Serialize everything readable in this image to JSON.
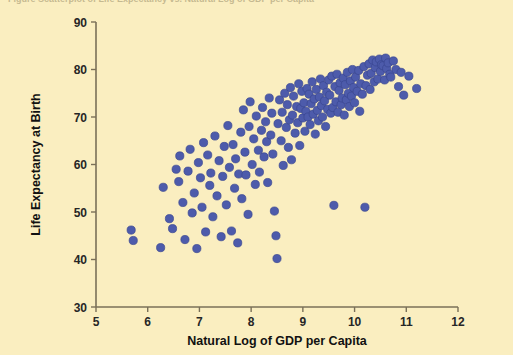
{
  "figure": {
    "cut_caption": "Figure   Scatterplot of Life Expectancy vs. Natural Log of GDP per Capita",
    "background_color": "#faeec0",
    "point_color": "#4d5bab",
    "point_edge_color": "#3a4690",
    "axis_color": "#7a7058",
    "text_color": "#111111"
  },
  "chart_data": {
    "type": "scatter",
    "title": "",
    "xlabel": "Natural Log of GDP per Capita",
    "ylabel": "Life Expectancy at Birth",
    "xlim": [
      5,
      12
    ],
    "ylim": [
      30,
      90
    ],
    "xticks": [
      5,
      6,
      7,
      8,
      9,
      10,
      11,
      12
    ],
    "yticks": [
      30,
      40,
      50,
      60,
      70,
      80,
      90
    ],
    "xtick_labels": [
      "5",
      "6",
      "7",
      "8",
      "9",
      "10",
      "11",
      "12"
    ],
    "ytick_labels": [
      "30",
      "40",
      "50",
      "60",
      "70",
      "80",
      "90"
    ],
    "grid": false,
    "legend": null,
    "marker": "circle",
    "marker_size": 8,
    "n_points": 172,
    "points": [
      [
        5.68,
        46.2
      ],
      [
        5.72,
        44.0
      ],
      [
        6.25,
        42.5
      ],
      [
        6.3,
        55.2
      ],
      [
        6.42,
        48.6
      ],
      [
        6.48,
        46.5
      ],
      [
        6.55,
        59.0
      ],
      [
        6.6,
        56.4
      ],
      [
        6.62,
        61.8
      ],
      [
        6.68,
        52.0
      ],
      [
        6.72,
        44.2
      ],
      [
        6.78,
        58.6
      ],
      [
        6.82,
        63.2
      ],
      [
        6.86,
        49.8
      ],
      [
        6.9,
        54.0
      ],
      [
        6.95,
        42.3
      ],
      [
        6.98,
        60.4
      ],
      [
        7.02,
        57.2
      ],
      [
        7.05,
        51.0
      ],
      [
        7.08,
        64.6
      ],
      [
        7.12,
        45.8
      ],
      [
        7.16,
        62.0
      ],
      [
        7.2,
        55.6
      ],
      [
        7.22,
        58.2
      ],
      [
        7.26,
        49.0
      ],
      [
        7.3,
        66.0
      ],
      [
        7.34,
        53.4
      ],
      [
        7.38,
        60.8
      ],
      [
        7.42,
        44.8
      ],
      [
        7.45,
        57.5
      ],
      [
        7.48,
        63.8
      ],
      [
        7.52,
        51.5
      ],
      [
        7.55,
        68.2
      ],
      [
        7.58,
        59.4
      ],
      [
        7.62,
        46.0
      ],
      [
        7.65,
        64.2
      ],
      [
        7.68,
        55.0
      ],
      [
        7.7,
        61.2
      ],
      [
        7.74,
        43.5
      ],
      [
        7.76,
        58.0
      ],
      [
        7.8,
        66.8
      ],
      [
        7.82,
        52.8
      ],
      [
        7.85,
        71.5
      ],
      [
        7.88,
        62.6
      ],
      [
        7.9,
        57.8
      ],
      [
        7.94,
        49.5
      ],
      [
        7.96,
        68.0
      ],
      [
        7.98,
        73.2
      ],
      [
        8.02,
        60.0
      ],
      [
        8.05,
        65.4
      ],
      [
        8.08,
        55.8
      ],
      [
        8.1,
        70.2
      ],
      [
        8.14,
        63.0
      ],
      [
        8.16,
        58.4
      ],
      [
        8.2,
        67.2
      ],
      [
        8.22,
        72.0
      ],
      [
        8.25,
        61.6
      ],
      [
        8.28,
        69.0
      ],
      [
        8.3,
        64.8
      ],
      [
        8.32,
        56.2
      ],
      [
        8.35,
        74.0
      ],
      [
        8.38,
        66.2
      ],
      [
        8.4,
        70.8
      ],
      [
        8.42,
        62.2
      ],
      [
        8.45,
        50.2
      ],
      [
        8.48,
        45.0
      ],
      [
        8.5,
        40.2
      ],
      [
        8.52,
        68.6
      ],
      [
        8.55,
        73.6
      ],
      [
        8.58,
        65.0
      ],
      [
        8.6,
        71.0
      ],
      [
        8.62,
        59.8
      ],
      [
        8.65,
        75.0
      ],
      [
        8.68,
        67.8
      ],
      [
        8.7,
        72.6
      ],
      [
        8.72,
        63.6
      ],
      [
        8.74,
        69.4
      ],
      [
        8.76,
        76.2
      ],
      [
        8.78,
        61.0
      ],
      [
        8.8,
        70.4
      ],
      [
        8.82,
        74.4
      ],
      [
        8.85,
        66.6
      ],
      [
        8.88,
        72.2
      ],
      [
        8.9,
        68.8
      ],
      [
        8.92,
        77.0
      ],
      [
        8.94,
        64.0
      ],
      [
        8.96,
        71.8
      ],
      [
        8.98,
        75.4
      ],
      [
        9.0,
        69.8
      ],
      [
        9.02,
        73.0
      ],
      [
        9.04,
        67.0
      ],
      [
        9.06,
        71.2
      ],
      [
        9.08,
        76.0
      ],
      [
        9.1,
        70.0
      ],
      [
        9.12,
        74.8
      ],
      [
        9.14,
        68.4
      ],
      [
        9.16,
        72.8
      ],
      [
        9.18,
        77.4
      ],
      [
        9.2,
        70.6
      ],
      [
        9.22,
        73.8
      ],
      [
        9.24,
        66.4
      ],
      [
        9.26,
        75.8
      ],
      [
        9.28,
        71.4
      ],
      [
        9.3,
        69.2
      ],
      [
        9.32,
        74.2
      ],
      [
        9.34,
        78.0
      ],
      [
        9.36,
        72.4
      ],
      [
        9.38,
        70.0
      ],
      [
        9.4,
        76.6
      ],
      [
        9.42,
        73.4
      ],
      [
        9.44,
        68.0
      ],
      [
        9.46,
        75.2
      ],
      [
        9.48,
        71.6
      ],
      [
        9.5,
        77.8
      ],
      [
        9.52,
        74.6
      ],
      [
        9.54,
        70.8
      ],
      [
        9.56,
        78.6
      ],
      [
        9.58,
        72.0
      ],
      [
        9.6,
        51.4
      ],
      [
        9.62,
        76.4
      ],
      [
        9.64,
        73.2
      ],
      [
        9.66,
        79.0
      ],
      [
        9.68,
        71.0
      ],
      [
        9.7,
        75.6
      ],
      [
        9.72,
        77.2
      ],
      [
        9.74,
        72.6
      ],
      [
        9.76,
        74.0
      ],
      [
        9.78,
        78.2
      ],
      [
        9.8,
        70.4
      ],
      [
        9.82,
        76.8
      ],
      [
        9.84,
        73.6
      ],
      [
        9.86,
        79.4
      ],
      [
        9.88,
        75.0
      ],
      [
        9.9,
        72.2
      ],
      [
        9.92,
        77.6
      ],
      [
        9.94,
        74.4
      ],
      [
        9.96,
        80.0
      ],
      [
        9.98,
        76.2
      ],
      [
        10.0,
        73.0
      ],
      [
        10.02,
        78.4
      ],
      [
        10.05,
        75.4
      ],
      [
        10.08,
        79.8
      ],
      [
        10.1,
        71.2
      ],
      [
        10.12,
        77.0
      ],
      [
        10.15,
        74.8
      ],
      [
        10.18,
        80.6
      ],
      [
        10.2,
        51.0
      ],
      [
        10.22,
        76.6
      ],
      [
        10.25,
        78.8
      ],
      [
        10.28,
        81.2
      ],
      [
        10.3,
        75.8
      ],
      [
        10.32,
        79.2
      ],
      [
        10.35,
        82.0
      ],
      [
        10.38,
        77.4
      ],
      [
        10.4,
        80.4
      ],
      [
        10.42,
        81.6
      ],
      [
        10.45,
        78.0
      ],
      [
        10.48,
        82.2
      ],
      [
        10.5,
        79.6
      ],
      [
        10.52,
        81.0
      ],
      [
        10.55,
        80.8
      ],
      [
        10.58,
        77.8
      ],
      [
        10.6,
        82.4
      ],
      [
        10.62,
        80.2
      ],
      [
        10.65,
        81.4
      ],
      [
        10.68,
        79.0
      ],
      [
        10.7,
        78.4
      ],
      [
        10.75,
        81.8
      ],
      [
        10.8,
        80.0
      ],
      [
        10.85,
        76.4
      ],
      [
        10.9,
        79.4
      ],
      [
        10.95,
        74.6
      ],
      [
        11.05,
        78.6
      ],
      [
        11.2,
        76.0
      ]
    ]
  }
}
